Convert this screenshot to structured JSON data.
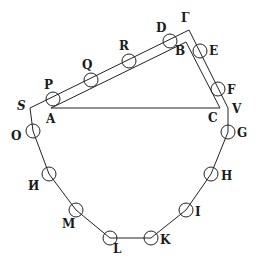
{
  "diagram": {
    "type": "geometric-figure",
    "points": {
      "S": {
        "label": "S",
        "x": 30,
        "y": 108
      },
      "A": {
        "label": "A",
        "x": 51,
        "y": 108
      },
      "Gamma": {
        "label": "Γ",
        "x": 189,
        "y": 30
      },
      "B": {
        "label": "B",
        "x": 186,
        "y": 42
      },
      "C": {
        "label": "C",
        "x": 220,
        "y": 108
      },
      "V": {
        "label": "V",
        "x": 228,
        "y": 115
      }
    },
    "circles": [
      {
        "label": "P",
        "x": 53,
        "y": 99
      },
      {
        "label": "Q",
        "x": 91,
        "y": 80
      },
      {
        "label": "R",
        "x": 129,
        "y": 61
      },
      {
        "label": "D",
        "x": 170,
        "y": 41
      },
      {
        "label": "E",
        "x": 200,
        "y": 51
      },
      {
        "label": "F",
        "x": 218,
        "y": 89
      },
      {
        "label": "G",
        "x": 228,
        "y": 132
      },
      {
        "label": "H",
        "x": 211,
        "y": 174
      },
      {
        "label": "I",
        "x": 186,
        "y": 210
      },
      {
        "label": "K",
        "x": 151,
        "y": 238
      },
      {
        "label": "L",
        "x": 110,
        "y": 238
      },
      {
        "label": "M",
        "x": 76,
        "y": 210
      },
      {
        "label": "N_reversed",
        "x": 49,
        "y": 174
      },
      {
        "label": "O",
        "x": 33,
        "y": 131
      }
    ],
    "labels": {
      "S": "S",
      "A": "A",
      "P": "P",
      "Q": "Q",
      "R": "R",
      "D": "D",
      "Gamma": "Γ",
      "B": "B",
      "E": "E",
      "F": "F",
      "C": "C",
      "V": "V",
      "G": "G",
      "H": "H",
      "I": "I",
      "K": "K",
      "L": "L",
      "M": "M",
      "N": "И",
      "O": "O"
    }
  }
}
